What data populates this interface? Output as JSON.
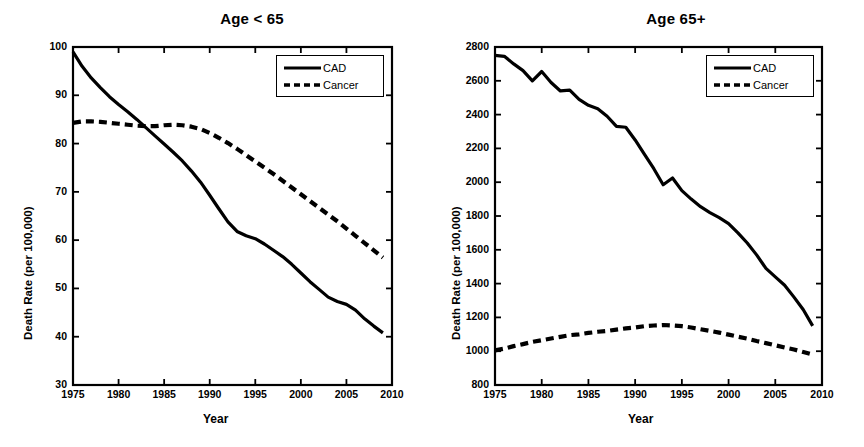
{
  "figure": {
    "background": "#ffffff",
    "ink": "#000000",
    "panels": [
      {
        "id": "age-under-65",
        "title": "Age < 65"
      },
      {
        "id": "age-65-plus",
        "title": "Age 65+"
      }
    ]
  },
  "chart_data": [
    {
      "type": "line",
      "title": "Age < 65",
      "xlabel": "Year",
      "ylabel": "Death Rate (per 100,000)",
      "xlim": [
        1975,
        2010
      ],
      "ylim": [
        30,
        100
      ],
      "xticks": [
        1975,
        1980,
        1985,
        1990,
        1995,
        2000,
        2005,
        2010
      ],
      "xticklabels": [
        "1975",
        "1980",
        "1985",
        "1990",
        "1995",
        "2000",
        "2005",
        "2010"
      ],
      "yticks": [
        30,
        40,
        50,
        60,
        70,
        80,
        90,
        100
      ],
      "yticklabels": [
        "30",
        "40",
        "50",
        "60",
        "70",
        "80",
        "90",
        "100"
      ],
      "grid": false,
      "legend_position": "upper right",
      "x": [
        1975,
        1976,
        1977,
        1978,
        1979,
        1980,
        1981,
        1982,
        1983,
        1984,
        1985,
        1986,
        1987,
        1988,
        1989,
        1990,
        1991,
        1992,
        1993,
        1994,
        1995,
        1996,
        1997,
        1998,
        1999,
        2000,
        2001,
        2002,
        2003,
        2004,
        2005,
        2006,
        2007,
        2008,
        2009
      ],
      "series": [
        {
          "name": "CAD",
          "style": "solid",
          "values": [
            99.0,
            96.0,
            93.6,
            91.6,
            89.7,
            88.1,
            86.6,
            85.0,
            83.3,
            81.6,
            79.9,
            78.2,
            76.4,
            74.3,
            72.0,
            69.3,
            66.5,
            63.8,
            61.8,
            60.9,
            60.3,
            59.2,
            57.9,
            56.6,
            55.0,
            53.2,
            51.4,
            49.8,
            48.2,
            47.3,
            46.7,
            45.5,
            43.7,
            42.2,
            40.8,
            39.3
          ]
        },
        {
          "name": "Cancer",
          "style": "dashed",
          "values": [
            84.3,
            84.6,
            84.6,
            84.5,
            84.3,
            84.1,
            83.9,
            83.7,
            83.6,
            83.6,
            83.8,
            83.9,
            83.8,
            83.5,
            83.0,
            82.2,
            81.2,
            80.1,
            78.9,
            77.6,
            76.3,
            75.0,
            73.7,
            72.3,
            70.9,
            69.5,
            68.1,
            66.7,
            65.3,
            63.9,
            62.4,
            60.9,
            59.4,
            57.9,
            56.4,
            55.6
          ]
        }
      ]
    },
    {
      "type": "line",
      "title": "Age 65+",
      "xlabel": "Year",
      "ylabel": "Death Rate (per 100,000)",
      "xlim": [
        1975,
        2010
      ],
      "ylim": [
        800,
        2800
      ],
      "xticks": [
        1975,
        1980,
        1985,
        1990,
        1995,
        2000,
        2005,
        2010
      ],
      "xticklabels": [
        "1975",
        "1980",
        "1985",
        "1990",
        "1995",
        "2000",
        "2005",
        "2010"
      ],
      "yticks": [
        800,
        1000,
        1200,
        1400,
        1600,
        1800,
        2000,
        2200,
        2400,
        2600,
        2800
      ],
      "yticklabels": [
        "800",
        "1000",
        "1200",
        "1400",
        "1600",
        "1800",
        "2000",
        "2200",
        "2400",
        "2600",
        "2800"
      ],
      "grid": false,
      "legend_position": "upper right",
      "x": [
        1975,
        1976,
        1977,
        1978,
        1979,
        1980,
        1981,
        1982,
        1983,
        1984,
        1985,
        1986,
        1987,
        1988,
        1989,
        1990,
        1991,
        1992,
        1993,
        1994,
        1995,
        1996,
        1997,
        1998,
        1999,
        2000,
        2001,
        2002,
        2003,
        2004,
        2005,
        2006,
        2007,
        2008,
        2009
      ],
      "series": [
        {
          "name": "CAD",
          "style": "solid",
          "values": [
            2750,
            2745,
            2700,
            2660,
            2600,
            2655,
            2590,
            2540,
            2545,
            2490,
            2455,
            2435,
            2390,
            2330,
            2325,
            2250,
            2165,
            2080,
            1985,
            2025,
            1950,
            1900,
            1855,
            1820,
            1790,
            1755,
            1700,
            1640,
            1570,
            1490,
            1440,
            1390,
            1320,
            1245,
            1150
          ]
        },
        {
          "name": "Cancer",
          "style": "dashed",
          "values": [
            1005,
            1015,
            1030,
            1042,
            1055,
            1065,
            1075,
            1085,
            1095,
            1100,
            1108,
            1115,
            1120,
            1128,
            1135,
            1140,
            1148,
            1152,
            1155,
            1152,
            1148,
            1140,
            1130,
            1120,
            1110,
            1098,
            1086,
            1074,
            1060,
            1048,
            1035,
            1022,
            1010,
            995,
            980
          ]
        }
      ]
    }
  ],
  "legend": {
    "entries": [
      {
        "label": "CAD",
        "style": "solid"
      },
      {
        "label": "Cancer",
        "style": "dashed"
      }
    ]
  }
}
